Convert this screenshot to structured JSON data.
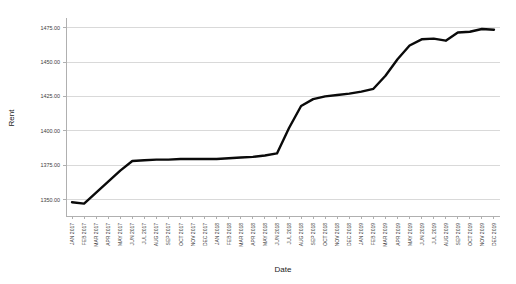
{
  "chart_data": {
    "type": "line",
    "title": "",
    "xlabel": "Date",
    "ylabel": "Rent",
    "ylim": [
      1338,
      1482
    ],
    "yticks": [
      1350,
      1375,
      1400,
      1425,
      1450,
      1475
    ],
    "ytick_labels": [
      "1350.00",
      "1375.00",
      "1400.00",
      "1425.00",
      "1450.00",
      "1475.00"
    ],
    "grid": true,
    "legend": false,
    "line_color": "#0a0a0a",
    "categories": [
      "JAN 2017",
      "FEB 2017",
      "MAR 2017",
      "APR 2017",
      "MAY 2017",
      "JUN 2017",
      "JUL 2017",
      "AUG 2017",
      "SEP 2017",
      "OCT 2017",
      "NOV 2017",
      "DEC 2017",
      "JAN 2018",
      "FEB 2018",
      "MAR 2018",
      "APR 2018",
      "MAY 2018",
      "JUN 2018",
      "JUL 2018",
      "AUG 2018",
      "SEP 2018",
      "OCT 2018",
      "NOV 2018",
      "DEC 2018",
      "JAN 2019",
      "FEB 2019",
      "MAR 2019",
      "APR 2019",
      "MAY 2019",
      "JUN 2019",
      "JUL 2019",
      "AUG 2019",
      "SEP 2019",
      "OCT 2019",
      "NOV 2019",
      "DEC 2019"
    ],
    "values": [
      1348.0,
      1347.0,
      1355.0,
      1363.0,
      1371.0,
      1378.0,
      1378.5,
      1379.0,
      1379.0,
      1379.5,
      1379.5,
      1379.5,
      1379.5,
      1380.0,
      1380.5,
      1381.0,
      1382.0,
      1383.5,
      1402.0,
      1418.0,
      1423.0,
      1425.0,
      1426.0,
      1427.0,
      1428.5,
      1430.5,
      1440.0,
      1452.0,
      1462.0,
      1466.5,
      1467.0,
      1465.5,
      1471.5,
      1472.0,
      1474.0,
      1473.5
    ]
  }
}
